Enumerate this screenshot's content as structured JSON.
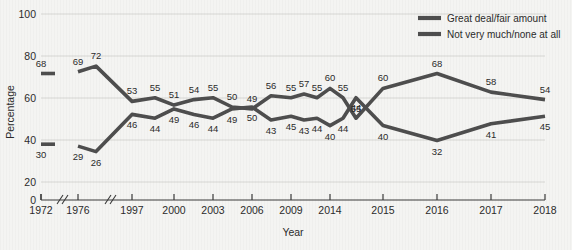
{
  "chart_data": {
    "type": "line",
    "title": "",
    "xlabel": "Year",
    "ylabel": "Percentage",
    "ylim": [
      0,
      100
    ],
    "yticks": [
      0,
      20,
      40,
      60,
      80,
      100
    ],
    "grid": true,
    "legend_position": "top-right",
    "axis_breaks": [
      "between 1972 and 1976",
      "between 1976 and 1997"
    ],
    "categories": [
      "1972",
      "1976",
      "1997",
      "1998",
      "2000",
      "2001",
      "2003",
      "2004",
      "2005",
      "2006",
      "2007",
      "2009",
      "2010",
      "2011",
      "2012",
      "2013",
      "2014",
      "2015",
      "2016",
      "2017",
      "2018"
    ],
    "series": [
      {
        "name": "Great deal/fair amount",
        "values": [
          68,
          69,
          72,
          53,
          55,
          51,
          54,
          55,
          50,
          49,
          56,
          55,
          57,
          55,
          60,
          55,
          44,
          60,
          68,
          58,
          54
        ]
      },
      {
        "name": "Not very much/none at all",
        "values": [
          30,
          29,
          26,
          46,
          44,
          49,
          46,
          44,
          49,
          50,
          43,
          45,
          43,
          44,
          40,
          44,
          55,
          40,
          32,
          41,
          45
        ]
      }
    ],
    "xticks": [
      "1972",
      "1976",
      "1997",
      "2000",
      "2003",
      "2006",
      "2009",
      "2014",
      "2015",
      "2016",
      "2017",
      "2018"
    ],
    "series_colors": [
      "#4e4e4e",
      "#4e4e4e"
    ]
  },
  "legend": {
    "entries": [
      {
        "label": "Great deal/fair amount"
      },
      {
        "label": "Not very much/none at all"
      }
    ]
  },
  "axes": {
    "y_title": "Percentage",
    "x_title": "Year",
    "y_tick_labels": [
      "0",
      "20",
      "40",
      "60",
      "80",
      "100"
    ],
    "x_tick_labels": [
      "1972",
      "1976",
      "1997",
      "2000",
      "2003",
      "2006",
      "2009",
      "2014",
      "2015",
      "2016",
      "2017",
      "2018"
    ]
  },
  "data_labels": {
    "upper": [
      "68",
      "69",
      "72",
      "53",
      "55",
      "51",
      "54",
      "55",
      "50",
      "49",
      "56",
      "55",
      "57",
      "55",
      "60",
      "55",
      "44",
      "60",
      "68",
      "58",
      "54"
    ],
    "lower": [
      "30",
      "29",
      "26",
      "46",
      "44",
      "49",
      "46",
      "44",
      "49",
      "50",
      "43",
      "45",
      "43",
      "44",
      "40",
      "44",
      "55",
      "40",
      "32",
      "41",
      "45"
    ]
  }
}
